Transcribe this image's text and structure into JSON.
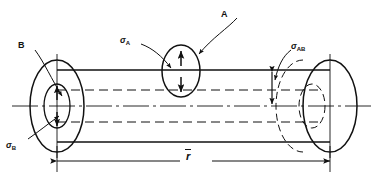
{
  "figure": {
    "type": "engineering-drawing",
    "background_color": "#ffffff",
    "line_color": "#111111"
  },
  "labels": {
    "element_a": "A",
    "element_b": "B",
    "stress_axial": "σ",
    "stress_axial_sub": "A",
    "stress_hoop": "σ",
    "stress_hoop_sub": "B",
    "stress_shear": "σ",
    "stress_shear_sub": "AB",
    "radius_dimension": "r"
  },
  "geometry": {
    "cylinder": {
      "left_x": 57,
      "right_x": 330,
      "top_y": 70,
      "bottom_y": 142,
      "centerline_y": 106,
      "inner_top_y": 90,
      "inner_bottom_y": 122
    },
    "left_face": {
      "cx": 57,
      "cy": 106,
      "rx": 27,
      "ry": 46
    },
    "left_inner_face": {
      "cx": 57,
      "cy": 106,
      "rx": 13,
      "ry": 22
    },
    "right_face": {
      "cx": 330,
      "cy": 106,
      "rx": 27,
      "ry": 46
    },
    "right_hidden_face": {
      "cx": 303,
      "cy": 106,
      "rx": 27,
      "ry": 46
    },
    "right_hidden_inner": {
      "cx": 312,
      "cy": 106,
      "rx": 13,
      "ry": 22
    },
    "element_a_ellipse": {
      "cx": 181,
      "cy": 71,
      "rx": 19,
      "ry": 26
    },
    "dimension_line_y": 161,
    "shear_dimension_x": 272
  }
}
